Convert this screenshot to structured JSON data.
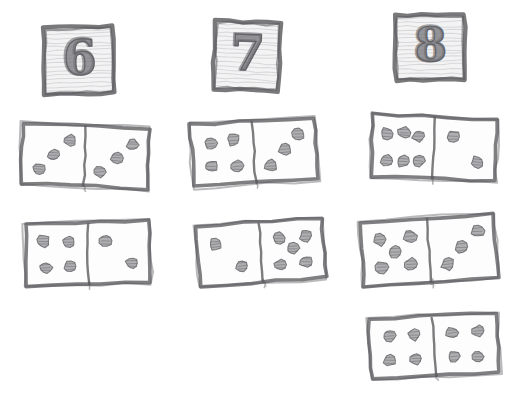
{
  "worksheet": {
    "title": "Domino sums sorting worksheet",
    "description": "Hand-drawn pencil sketch: three labelled number cards with dominoes whose pips add to that number",
    "background_color": "#ffffff",
    "pencil_color": "#5b5b5f",
    "pip_color": "#6f6f75",
    "columns": [
      {
        "id": "column-6",
        "card": {
          "label": "6",
          "x": 44,
          "y": 27,
          "width": 70,
          "height": 67,
          "rotation": -1.5
        },
        "dominoes": [
          {
            "id": "domino-3-3",
            "left_pips": 3,
            "right_pips": 3,
            "sum": 6,
            "x": 22,
            "y": 126,
            "width": 126,
            "height": 60,
            "rotation": 2.5
          },
          {
            "id": "domino-4-2",
            "left_pips": 4,
            "right_pips": 2,
            "sum": 6,
            "x": 26,
            "y": 222,
            "width": 124,
            "height": 62,
            "rotation": -1.5
          }
        ]
      },
      {
        "id": "column-7",
        "card": {
          "label": "7",
          "x": 214,
          "y": 22,
          "width": 66,
          "height": 68,
          "rotation": 2.0
        },
        "dominoes": [
          {
            "id": "domino-4-3",
            "left_pips": 4,
            "right_pips": 3,
            "sum": 7,
            "x": 192,
            "y": 121,
            "width": 124,
            "height": 62,
            "rotation": -3.5
          },
          {
            "id": "domino-2-5",
            "left_pips": 2,
            "right_pips": 5,
            "sum": 7,
            "x": 198,
            "y": 222,
            "width": 126,
            "height": 60,
            "rotation": -4.0
          }
        ]
      },
      {
        "id": "column-8",
        "card": {
          "label": "8",
          "x": 395,
          "y": 15,
          "width": 70,
          "height": 65,
          "rotation": -1.0
        },
        "dominoes": [
          {
            "id": "domino-6-2",
            "left_pips": 6,
            "right_pips": 2,
            "sum": 8,
            "x": 372,
            "y": 117,
            "width": 124,
            "height": 62,
            "rotation": 2.5
          },
          {
            "id": "domino-5-3",
            "left_pips": 5,
            "right_pips": 3,
            "sum": 8,
            "x": 362,
            "y": 218,
            "width": 134,
            "height": 64,
            "rotation": -4.0
          },
          {
            "id": "domino-4-4",
            "left_pips": 4,
            "right_pips": 4,
            "sum": 8,
            "x": 370,
            "y": 316,
            "width": 128,
            "height": 60,
            "rotation": -3.0
          }
        ]
      }
    ]
  },
  "pip_layouts": {
    "1": [
      [
        50,
        50
      ]
    ],
    "2": [
      [
        30,
        30
      ],
      [
        70,
        70
      ]
    ],
    "3": [
      [
        26,
        74
      ],
      [
        50,
        50
      ],
      [
        74,
        26
      ]
    ],
    "4": [
      [
        30,
        30
      ],
      [
        70,
        30
      ],
      [
        30,
        70
      ],
      [
        70,
        70
      ]
    ],
    "5": [
      [
        28,
        28
      ],
      [
        72,
        28
      ],
      [
        50,
        50
      ],
      [
        28,
        72
      ],
      [
        72,
        72
      ]
    ],
    "6": [
      [
        24,
        28
      ],
      [
        50,
        26
      ],
      [
        76,
        30
      ],
      [
        24,
        72
      ],
      [
        50,
        74
      ],
      [
        76,
        70
      ]
    ]
  }
}
